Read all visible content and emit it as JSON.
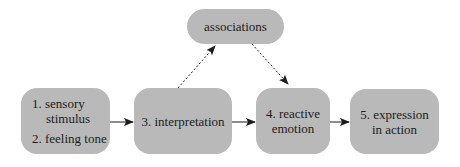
{
  "diagram": {
    "nodes": {
      "sensory": {
        "line1": "1. sensory",
        "line2": "stimulus",
        "line3": "2. feeling tone"
      },
      "interpretation": {
        "label": "3. interpretation"
      },
      "reactive": {
        "line1": "4. reactive",
        "line2": "emotion"
      },
      "expression": {
        "line1": "5. expression",
        "line2": "in action"
      },
      "associations": {
        "label": "associations"
      }
    },
    "edges": [
      {
        "from": "sensory",
        "to": "interpretation",
        "style": "solid"
      },
      {
        "from": "interpretation",
        "to": "reactive",
        "style": "solid"
      },
      {
        "from": "reactive",
        "to": "expression",
        "style": "solid"
      },
      {
        "from": "interpretation",
        "to": "associations",
        "style": "dotted"
      },
      {
        "from": "associations",
        "to": "reactive",
        "style": "dotted"
      }
    ],
    "colors": {
      "box_fill": "#b9b9b9",
      "text": "#1c1c1c",
      "arrow": "#1c1c1c"
    }
  }
}
